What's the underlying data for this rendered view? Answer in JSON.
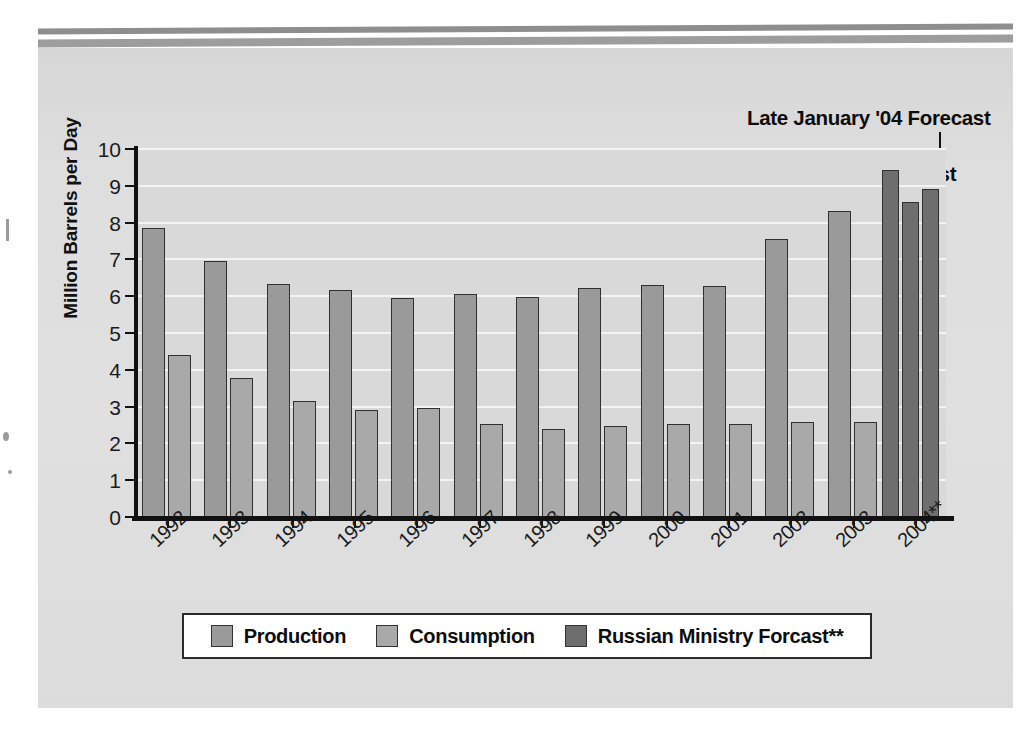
{
  "chart_data": {
    "type": "bar",
    "title": "",
    "xlabel": "",
    "ylabel": "Million Barrels per Day",
    "ylim": [
      0,
      10
    ],
    "yticks": [
      0,
      1,
      2,
      3,
      4,
      5,
      6,
      7,
      8,
      9,
      10
    ],
    "grid": true,
    "legend_position": "bottom",
    "categories": [
      "1992",
      "1993",
      "1994",
      "1995",
      "1996",
      "1997",
      "1998",
      "1999",
      "2000",
      "2001",
      "2002",
      "2003",
      "2004**"
    ],
    "series": [
      {
        "name": "Production",
        "color": "#9a9a9a",
        "values": [
          7.85,
          6.97,
          6.32,
          6.18,
          5.95,
          6.05,
          5.98,
          6.23,
          6.3,
          6.29,
          7.55,
          8.32,
          null
        ]
      },
      {
        "name": "Consumption",
        "color": "#a9a9a9",
        "values": [
          4.4,
          3.77,
          3.15,
          2.92,
          2.97,
          2.53,
          2.4,
          2.46,
          2.54,
          2.52,
          2.58,
          2.58,
          null
        ]
      },
      {
        "name": "Russian Ministry Forcast**",
        "color": "#6e6e6e",
        "values": [
          null,
          null,
          null,
          null,
          null,
          null,
          null,
          null,
          null,
          null,
          null,
          null,
          [
            9.42,
            8.56,
            8.9
          ]
        ]
      }
    ],
    "forecast_bars": [
      {
        "label": "12/03 Forecast",
        "value": 9.42
      },
      {
        "label": "Early January '04 Forecast",
        "value": 8.56
      },
      {
        "label": "Late January '04 Forecast",
        "value": 8.9
      }
    ],
    "annotations": [
      {
        "name": "late-january-forecast",
        "text": "Late January '04 Forecast"
      },
      {
        "name": "early-january-forecast",
        "text": "Early January '04 Forecast"
      },
      {
        "name": "december-forecast",
        "text": "12/03 Forecast"
      }
    ]
  },
  "legend": {
    "items": [
      {
        "label": "Production",
        "color": "#9a9a9a"
      },
      {
        "label": "Consumption",
        "color": "#a9a9a9"
      },
      {
        "label": "Russian Ministry Forcast**",
        "color": "#6e6e6e"
      }
    ]
  },
  "colors": {
    "panel_background": "#dcdcdc",
    "plot_background": "#d9d9d9",
    "gridline": "#f3f3f3",
    "axis": "#111111",
    "production": "#9a9a9a",
    "consumption": "#a9a9a9",
    "ministry_forecast": "#6e6e6e",
    "legend_background": "#ffffff"
  }
}
